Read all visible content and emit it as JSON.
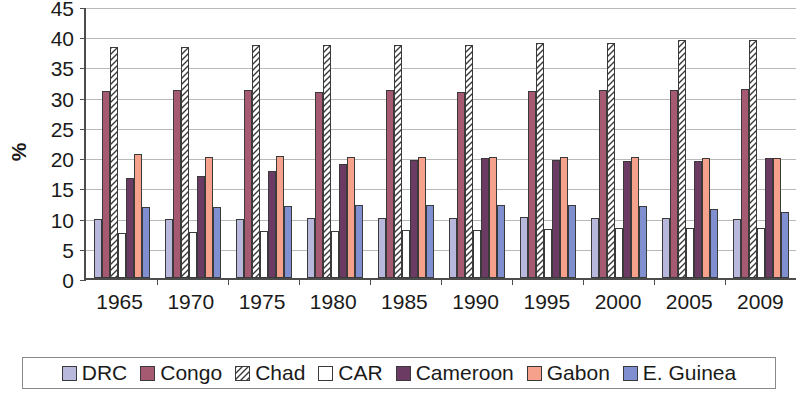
{
  "chart_data": {
    "type": "bar",
    "title": "",
    "xlabel": "",
    "ylabel": "%",
    "ylim": [
      0,
      45
    ],
    "yticks": [
      0,
      5,
      10,
      15,
      20,
      25,
      30,
      35,
      40,
      45
    ],
    "grid": true,
    "legend_position": "bottom",
    "categories": [
      "1965",
      "1970",
      "1975",
      "1980",
      "1985",
      "1990",
      "1995",
      "2000",
      "2005",
      "2009"
    ],
    "series": [
      {
        "name": "DRC",
        "color": "#b8b8dd",
        "pattern": "solid",
        "values": [
          9.8,
          9.8,
          9.8,
          10.0,
          10.0,
          10.0,
          10.1,
          9.9,
          9.9,
          9.8
        ]
      },
      {
        "name": "Congo",
        "color": "#a55a72",
        "pattern": "solid",
        "values": [
          31.0,
          31.1,
          31.1,
          30.8,
          31.1,
          30.8,
          30.9,
          31.1,
          31.1,
          31.2
        ]
      },
      {
        "name": "Chad",
        "color": "#ffffff",
        "pattern": "diagonal-hatch",
        "values": [
          38.2,
          38.2,
          38.5,
          38.6,
          38.5,
          38.6,
          38.8,
          38.8,
          39.4,
          39.4
        ]
      },
      {
        "name": "CAR",
        "color": "#ffffff",
        "pattern": "solid",
        "values": [
          7.5,
          7.6,
          7.7,
          7.8,
          7.9,
          8.0,
          8.1,
          8.2,
          8.3,
          8.3
        ]
      },
      {
        "name": "Cameroon",
        "color": "#6b3b63",
        "pattern": "solid",
        "values": [
          16.5,
          16.9,
          17.7,
          18.9,
          19.5,
          19.8,
          19.5,
          19.4,
          19.4,
          19.9
        ]
      },
      {
        "name": "Gabon",
        "color": "#f5a18b",
        "pattern": "solid",
        "values": [
          20.6,
          20.1,
          20.2,
          20.1,
          20.0,
          20.1,
          20.0,
          20.1,
          19.8,
          19.9
        ]
      },
      {
        "name": "E. Guinea",
        "color": "#7f8fd0",
        "pattern": "solid",
        "values": [
          11.7,
          11.7,
          11.9,
          12.0,
          12.0,
          12.0,
          12.0,
          11.9,
          11.5,
          10.9
        ]
      }
    ]
  }
}
